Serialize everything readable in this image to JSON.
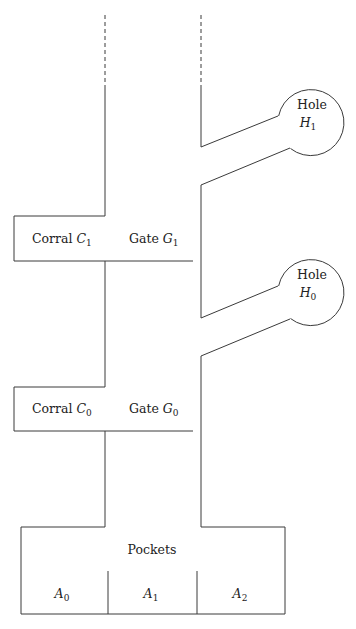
{
  "diagram": {
    "holes": [
      {
        "label": "Hole",
        "symbol": "H",
        "index": "1"
      },
      {
        "label": "Hole",
        "symbol": "H",
        "index": "0"
      }
    ],
    "corrals": [
      {
        "label": "Corral",
        "symbol": "C",
        "index": "1"
      },
      {
        "label": "Corral",
        "symbol": "C",
        "index": "0"
      }
    ],
    "gates": [
      {
        "label": "Gate",
        "symbol": "G",
        "index": "1"
      },
      {
        "label": "Gate",
        "symbol": "G",
        "index": "0"
      }
    ],
    "pockets": {
      "title": "Pockets",
      "cells": [
        {
          "symbol": "A",
          "index": "0"
        },
        {
          "symbol": "A",
          "index": "1"
        },
        {
          "symbol": "A",
          "index": "2"
        }
      ]
    },
    "line_color": "#3a3a3a"
  }
}
